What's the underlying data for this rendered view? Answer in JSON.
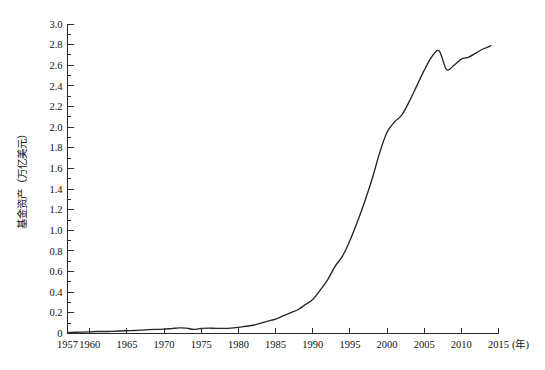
{
  "chart_data": {
    "type": "line",
    "title": "",
    "subtitle": "",
    "xlabel": "(年)",
    "ylabel": "基金资产（万亿美元）",
    "xlim": [
      1957,
      2015
    ],
    "ylim": [
      0,
      3.0
    ],
    "grid": false,
    "legend": false,
    "legend_position": "none",
    "line_color": "#262626",
    "background_color": "#ffffff",
    "axis_color": "#2b2b2b",
    "y_tick_labels": [
      "3.0",
      "2.8",
      "2.6",
      "2.4",
      "2.2",
      "2.0",
      "1.8",
      "1.6",
      "1.4",
      "1.2",
      "1.0",
      "0.8",
      "0.6",
      "0.4",
      "0.2",
      "0"
    ],
    "y_tick_values": [
      3.0,
      2.8,
      2.6,
      2.4,
      2.2,
      2.0,
      1.8,
      1.6,
      1.4,
      1.2,
      1.0,
      0.8,
      0.6,
      0.4,
      0.2,
      0
    ],
    "y_minor_step": 0.1,
    "x_tick_labels": [
      "1957",
      "1960",
      "1965",
      "1970",
      "1975",
      "1980",
      "1985",
      "1990",
      "1995",
      "2000",
      "2005",
      "2010",
      "2015"
    ],
    "x_tick_values": [
      1957,
      1960,
      1965,
      1970,
      1975,
      1980,
      1985,
      1990,
      1995,
      2000,
      2005,
      2010,
      2015
    ],
    "series": [
      {
        "name": "基金资产",
        "x": [
          1957,
          1958,
          1959,
          1960,
          1961,
          1962,
          1963,
          1964,
          1965,
          1966,
          1967,
          1968,
          1969,
          1970,
          1971,
          1972,
          1973,
          1974,
          1975,
          1976,
          1977,
          1978,
          1979,
          1980,
          1981,
          1982,
          1983,
          1984,
          1985,
          1986,
          1987,
          1988,
          1989,
          1990,
          1991,
          1992,
          1993,
          1994,
          1995,
          1996,
          1997,
          1998,
          1999,
          2000,
          2001,
          2002,
          2003,
          2004,
          2005,
          2006,
          2007,
          2008,
          2009,
          2010,
          2011,
          2012,
          2013,
          2014
        ],
        "values": [
          0.01,
          0.012,
          0.014,
          0.016,
          0.019,
          0.019,
          0.021,
          0.024,
          0.027,
          0.029,
          0.033,
          0.038,
          0.04,
          0.042,
          0.048,
          0.055,
          0.052,
          0.04,
          0.05,
          0.052,
          0.05,
          0.049,
          0.052,
          0.06,
          0.07,
          0.08,
          0.1,
          0.12,
          0.14,
          0.17,
          0.2,
          0.23,
          0.28,
          0.33,
          0.42,
          0.52,
          0.65,
          0.75,
          0.9,
          1.08,
          1.28,
          1.5,
          1.75,
          1.95,
          2.05,
          2.12,
          2.25,
          2.4,
          2.55,
          2.68,
          2.74,
          2.56,
          2.6,
          2.66,
          2.68,
          2.72,
          2.76,
          2.79
        ]
      }
    ]
  },
  "axes": {
    "y_axis_title": "基金资产（万亿美元）",
    "x_axis_unit_label": "(年)"
  }
}
